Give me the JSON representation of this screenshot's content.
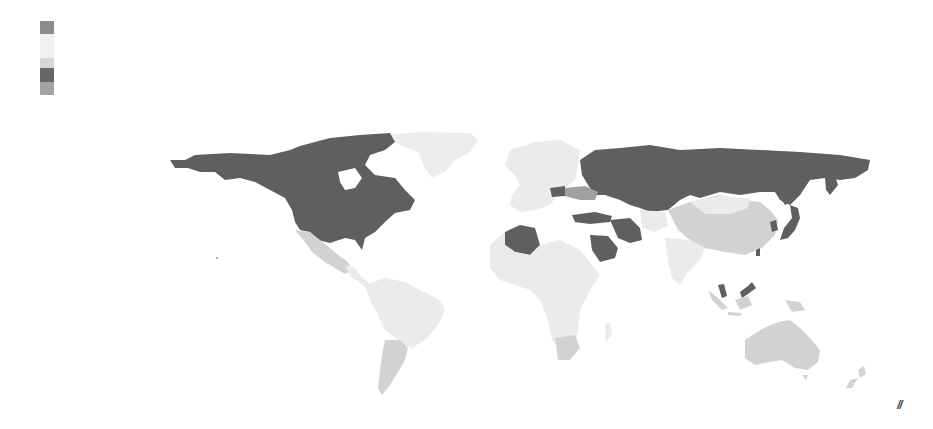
{
  "legend": {
    "swatches": [
      {
        "color": "#8c8c8c",
        "height": 13
      },
      {
        "color": "#f1f1f1",
        "height": 24
      },
      {
        "color": "#d6d6d6",
        "height": 10
      },
      {
        "color": "#666666",
        "height": 14
      },
      {
        "color": "#a3a3a3",
        "height": 13
      }
    ]
  },
  "map": {
    "type": "choropleth",
    "projection": "equirectangular-like",
    "categories": {
      "dark": "#5f5f5f",
      "medium": "#a0a0a0",
      "light": "#d2d2d2",
      "very_light": "#ebebeb"
    },
    "regions": [
      {
        "name": "Canada/USA/Alaska",
        "shade": "dark"
      },
      {
        "name": "Mexico",
        "shade": "light"
      },
      {
        "name": "Greenland",
        "shade": "very_light"
      },
      {
        "name": "South America",
        "shade": "very_light"
      },
      {
        "name": "Argentina",
        "shade": "light"
      },
      {
        "name": "Europe",
        "shade": "very_light"
      },
      {
        "name": "Russia",
        "shade": "dark"
      },
      {
        "name": "Kazakhstan",
        "shade": "dark"
      },
      {
        "name": "Ukraine region",
        "shade": "medium"
      },
      {
        "name": "Turkey",
        "shade": "dark"
      },
      {
        "name": "Iran",
        "shade": "dark"
      },
      {
        "name": "Saudi Arabia",
        "shade": "dark"
      },
      {
        "name": "Algeria",
        "shade": "dark"
      },
      {
        "name": "Africa",
        "shade": "very_light"
      },
      {
        "name": "South Africa",
        "shade": "light"
      },
      {
        "name": "China",
        "shade": "light"
      },
      {
        "name": "Mongolia",
        "shade": "very_light"
      },
      {
        "name": "India",
        "shade": "very_light"
      },
      {
        "name": "Japan",
        "shade": "dark"
      },
      {
        "name": "Malaysia",
        "shade": "dark"
      },
      {
        "name": "Indonesia",
        "shade": "light"
      },
      {
        "name": "Australia",
        "shade": "light"
      },
      {
        "name": "New Zealand",
        "shade": "light"
      }
    ]
  },
  "corner_mark": "//"
}
